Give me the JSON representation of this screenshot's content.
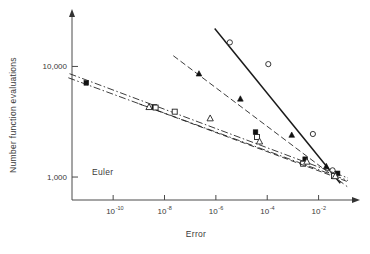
{
  "figure": {
    "method_label": "Euler",
    "background": "#ffffff",
    "ink_color": "#1a1a1a"
  },
  "axes": {
    "x": {
      "title": "Error",
      "scale": "log",
      "tick_labels": [
        "10",
        "10",
        "10",
        "10",
        "10"
      ],
      "tick_exponents": [
        "-10",
        "-8",
        "-6",
        "-4",
        "-2"
      ],
      "tick_values": [
        1e-10,
        1e-08,
        1e-06,
        0.0001,
        0.01
      ],
      "range_exp": [
        -11.6,
        -0.7
      ]
    },
    "y": {
      "title": "Number function evaluations",
      "scale": "log",
      "tick_labels": [
        "10,000",
        "1,000"
      ],
      "tick_values": [
        10000,
        1000
      ],
      "range": [
        620,
        28000
      ]
    }
  },
  "chart_data": {
    "type": "line",
    "title": "",
    "subtitle": "",
    "xlabel": "Error",
    "ylabel": "Number function evaluations",
    "xscale": "log",
    "yscale": "log",
    "xlim": [
      2.5e-12,
      0.2
    ],
    "ylim": [
      620,
      28000
    ],
    "grid": false,
    "legend": "none",
    "annotations": [
      {
        "text": "Euler",
        "x": 3e-10,
        "y": 790
      }
    ],
    "xtick_values": [
      1e-10,
      1e-08,
      1e-06,
      0.0001,
      0.01
    ],
    "xtick_labels": [
      "10^-10",
      "10^-8",
      "10^-6",
      "10^-4",
      "10^-2"
    ],
    "ytick_values": [
      10000,
      1000
    ],
    "ytick_labels": [
      "10,000",
      "1,000"
    ],
    "series": [
      {
        "name": "open-circle-steep",
        "marker": "circle-open",
        "linestyle": "solid",
        "x": [
          3.5e-06,
          0.00011,
          0.006,
          0.035
        ],
        "y": [
          16500,
          10500,
          2450,
          1150
        ],
        "fit_x": [
          9e-07,
          0.07
        ],
        "fit_y": [
          22000,
          880
        ]
      },
      {
        "name": "filled-triangle",
        "marker": "triangle-filled",
        "linestyle": "dashed",
        "x": [
          2.2e-07,
          9e-06,
          0.0009,
          0.02
        ],
        "y": [
          8600,
          5100,
          2400,
          1250
        ],
        "fit_x": [
          2.2e-08,
          0.13
        ],
        "fit_y": [
          12500,
          820
        ]
      },
      {
        "name": "filled-square",
        "marker": "square-filled",
        "linestyle": "dashdot",
        "x": [
          9e-12,
          4e-09,
          3.5e-05,
          0.003,
          0.055
        ],
        "y": [
          7100,
          4300,
          2550,
          1450,
          1080
        ],
        "fit_x": [
          2e-12,
          0.14
        ],
        "fit_y": [
          8600,
          980
        ]
      },
      {
        "name": "open-square",
        "marker": "square-open",
        "linestyle": "dashdot",
        "x": [
          4.5e-09,
          2.5e-08,
          4e-05,
          0.0025,
          0.04
        ],
        "y": [
          4250,
          3900,
          2300,
          1320,
          1020
        ],
        "fit_x": [
          1.8e-12,
          0.14
        ],
        "fit_y": [
          7900,
          930
        ]
      },
      {
        "name": "open-triangle",
        "marker": "triangle-open",
        "linestyle": "dashed",
        "x": [
          2.5e-09,
          6e-07,
          5e-05,
          0.0035,
          0.045
        ],
        "y": [
          4300,
          3400,
          2100,
          1380,
          1020
        ],
        "fit_x": [
          1e-09,
          0.15
        ],
        "fit_y": [
          4600,
          900
        ]
      }
    ]
  }
}
